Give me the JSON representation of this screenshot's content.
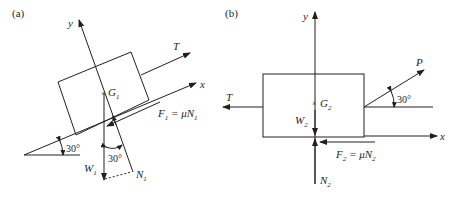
{
  "panel_a": {
    "label": "(a)",
    "axis_x": "x",
    "axis_y": "y",
    "tension": "T",
    "centroid": "G",
    "centroid_sub": "1",
    "friction": "F",
    "friction_sub": "1",
    "friction_eq": " = μN",
    "friction_eq_sub": "1",
    "weight": "W",
    "weight_sub": "1",
    "normal": "N",
    "normal_sub": "1",
    "incline_angle": "30°",
    "normal_angle": "30°"
  },
  "panel_b": {
    "label": "(b)",
    "axis_x": "x",
    "axis_y": "y",
    "tension": "T",
    "pull": "P",
    "centroid": "G",
    "centroid_sub": "2",
    "friction": "F",
    "friction_sub": "2",
    "friction_eq": " = μN",
    "friction_eq_sub": "2",
    "weight": "W",
    "weight_sub": "2",
    "normal": "N",
    "normal_sub": "2",
    "pull_angle": "30°"
  },
  "colors": {
    "ink": "#231f20",
    "background": "#ffffff"
  }
}
